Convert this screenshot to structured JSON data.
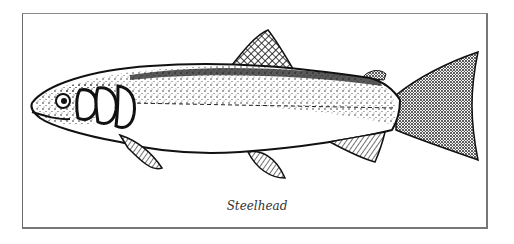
{
  "illustration": {
    "subject": "fish",
    "style": "stippled black-and-white line drawing",
    "caption": "Steelhead"
  },
  "colors": {
    "ink": "#111111",
    "paper": "#ffffff",
    "border": "#777777"
  }
}
